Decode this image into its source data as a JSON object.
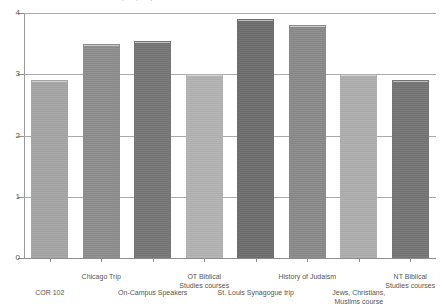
{
  "chart": {
    "title_remnant": "Student self-assessment ratings by experience",
    "yaxis": {
      "ticks": [
        "0",
        "1",
        "2",
        "3",
        "4"
      ],
      "min": 0,
      "max": 4
    }
  },
  "chart_data": {
    "type": "bar",
    "title": "",
    "xlabel": "",
    "ylabel": "",
    "ylim": [
      0,
      4
    ],
    "yticks": [
      0,
      1,
      2,
      3,
      4
    ],
    "grid": true,
    "legend": "none",
    "categories": [
      "COR 102",
      "Chicago Trip",
      "On-Campus Speakers",
      "OT Biblical\nStudies courses",
      "St. Louis Synagogue trip",
      "History of Judaism",
      "Jews, Christians,\nMuslims course",
      "NT Biblical\nStudies courses"
    ],
    "category_lines": [
      [
        "COR 102"
      ],
      [
        "Chicago Trip"
      ],
      [
        "On-Campus Speakers"
      ],
      [
        "OT Biblical",
        "Studies courses"
      ],
      [
        "St. Louis Synagogue trip"
      ],
      [
        "History of Judaism"
      ],
      [
        "Jews, Christians,",
        "Muslims course"
      ],
      [
        "NT Biblical",
        "Studies courses"
      ]
    ],
    "values": [
      2.9,
      3.5,
      3.55,
      3.0,
      3.9,
      3.8,
      3.0,
      2.9
    ],
    "colors": [
      "#a5a5a5",
      "#8e8e8e",
      "#767676",
      "#b3b3b3",
      "#6e6e6e",
      "#8a8a8a",
      "#aeaeae",
      "#757575"
    ],
    "label_rows": [
      "bottom",
      "top",
      "bottom",
      "top",
      "bottom",
      "top",
      "bottom",
      "top"
    ]
  }
}
